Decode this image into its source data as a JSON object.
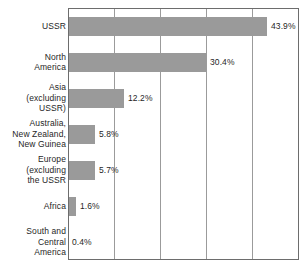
{
  "chart_data": {
    "type": "bar",
    "orientation": "horizontal",
    "title": "",
    "subtitle": "",
    "xlabel": "",
    "ylabel": "",
    "xlim": [
      0,
      51.3
    ],
    "grid": true,
    "gridlines_x": [
      10,
      20,
      30,
      40
    ],
    "legend": "none",
    "value_suffix": "%",
    "categories": [
      "USSR",
      "North\nAmerica",
      "Asia\n(excluding\nUSSR)",
      "Australia,\nNew Zealand,\nNew Guinea",
      "Europe\n(excluding\nthe USSR",
      "Africa",
      "South and\nCentral\nAmerica"
    ],
    "values": [
      43.9,
      30.4,
      12.2,
      5.8,
      5.7,
      1.6,
      0.4
    ],
    "data_labels": [
      "43.9%",
      "30.4%",
      "12.2%",
      "5.8%",
      "5.7%",
      "1.6%",
      "0.4%"
    ],
    "colors": {
      "bar_fill": "#9a9a9a",
      "frame": "#6d6d6d",
      "gridline": "#9b9b9b",
      "text": "#1f1f1f",
      "background": "#ffffff"
    }
  }
}
